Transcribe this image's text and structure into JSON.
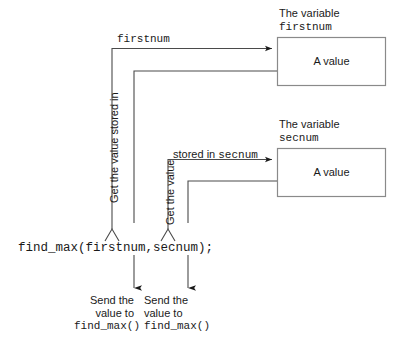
{
  "diagram": {
    "title_hidden": "Passing values to a function diagram",
    "code_statement": "find_max(firstnum,secnum);",
    "variables": [
      {
        "caption_line1": "The variable",
        "caption_line2": "firstnum",
        "box_text": "A value",
        "inbound_arrow_label": "firstnum",
        "fetch_label": "Get the value stored in"
      },
      {
        "caption_line1": "The variable",
        "caption_line2": "secnum",
        "box_text": "A value",
        "inbound_arrow_label_prefix": "stored in ",
        "inbound_arrow_label_mono": "secnum",
        "fetch_label": "Get the value"
      }
    ],
    "send_notes": [
      {
        "line1": "Send the",
        "line2": "value to",
        "line3": "find_max()"
      },
      {
        "line1": "Send the",
        "line2": "value to",
        "line3": "find_max()"
      }
    ],
    "colors": {
      "background": "#ffffff",
      "box_stroke": "#8a8a8a",
      "line_stroke": "#4a4a4a",
      "arrow_fill": "#1a1a1a",
      "text": "#1a1a1a"
    }
  }
}
